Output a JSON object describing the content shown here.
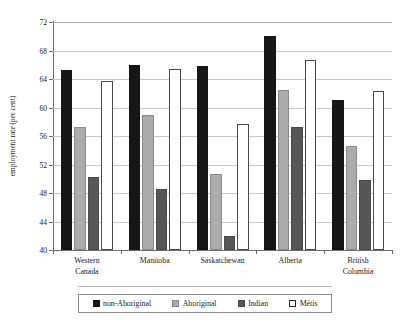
{
  "chart_data": {
    "type": "bar",
    "title": "",
    "subtitle": "",
    "xlabel": "",
    "ylabel": "employment rate (per cent)",
    "ylim": [
      40,
      72
    ],
    "yticks": [
      40,
      44,
      48,
      52,
      56,
      60,
      64,
      68,
      72
    ],
    "ytick_labels": [
      "40",
      "44",
      "48",
      "52",
      "56",
      "60",
      "64",
      "68",
      "72"
    ],
    "grid": true,
    "grid_axis": "y",
    "legend_position": "bottom",
    "categories": [
      "Western\nCanada",
      "Manitoba",
      "Saskatchewan",
      "Alberta",
      "British\nColumbia"
    ],
    "category_lines": [
      [
        "Western",
        "Canada"
      ],
      [
        "Manitoba"
      ],
      [
        "Saskatchewan"
      ],
      [
        "Alberta"
      ],
      [
        "British",
        "Columbia"
      ]
    ],
    "series": [
      {
        "name": "non-Aboriginal",
        "color": "#161616",
        "values": [
          65.2,
          65.9,
          65.8,
          70.0,
          61.0
        ]
      },
      {
        "name": "Aboriginal",
        "color": "#ababab",
        "values": [
          57.2,
          59.0,
          50.7,
          62.4,
          54.6
        ]
      },
      {
        "name": "Indian",
        "color": "#565656",
        "values": [
          50.2,
          48.5,
          42.0,
          57.3,
          49.8
        ]
      },
      {
        "name": "Métis",
        "color": "#ffffff",
        "values": [
          63.7,
          65.4,
          57.7,
          66.6,
          62.3
        ]
      }
    ]
  },
  "legend": {
    "items": [
      {
        "label": "non-Aboriginal"
      },
      {
        "label": "Aboriginal"
      },
      {
        "label": "Indian"
      },
      {
        "label": "Métis"
      }
    ]
  }
}
